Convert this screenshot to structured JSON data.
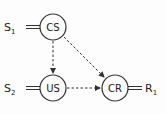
{
  "nodes": {
    "cs": {
      "label": "CS"
    },
    "us": {
      "label": "US"
    },
    "cr": {
      "label": "CR"
    }
  },
  "inputs": {
    "s1": {
      "base": "S",
      "sub": "1"
    },
    "s2": {
      "base": "S",
      "sub": "2"
    }
  },
  "outputs": {
    "r1": {
      "base": "R",
      "sub": "1"
    }
  },
  "edges": [
    {
      "from": "CS",
      "to": "US",
      "style": "dashed-arrow"
    },
    {
      "from": "CS",
      "to": "CR",
      "style": "dashed-arrow"
    },
    {
      "from": "US",
      "to": "CR",
      "style": "dashed-arrow"
    }
  ],
  "colors": {
    "stroke": "#333333",
    "background": "#fdfdfd"
  }
}
